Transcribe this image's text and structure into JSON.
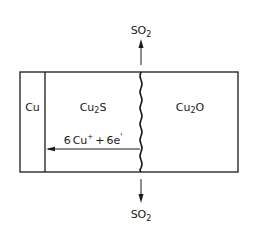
{
  "diagram": {
    "layers": [
      {
        "label": "Cu",
        "sub": ""
      },
      {
        "label_main": "Cu",
        "label_sub": "2",
        "label_tail": "S"
      },
      {
        "label_main": "Cu",
        "label_sub": "2",
        "label_tail": "O"
      }
    ],
    "top_gas": {
      "main": "SO",
      "sub": "2"
    },
    "bottom_gas": {
      "main": "SO",
      "sub": "2"
    },
    "transport": {
      "coef1": "6",
      "species1": "Cu",
      "sup1": "+",
      "plus": "+",
      "coef2": "6",
      "species2": "e",
      "sup2": "'"
    },
    "colors": {
      "line": "#1a1a1a",
      "background": "#ffffff"
    }
  }
}
